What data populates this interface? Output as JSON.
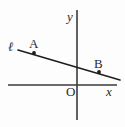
{
  "figure": {
    "background_color": "#fdfdfd",
    "stroke_color": "#1f1f1f",
    "axis_color": "#3a3a3a",
    "labels": {
      "line_name": "ℓ",
      "point_a": "A",
      "point_b": "B",
      "x_axis": "x",
      "y_axis": "y",
      "origin": "O"
    }
  },
  "chart_data": {
    "type": "line",
    "title": "",
    "xlabel": "x",
    "ylabel": "y",
    "grid": false,
    "legend": null,
    "axes": {
      "x_axis": {
        "label": "x",
        "orientation": "horizontal",
        "pixel_y": 85,
        "pixel_x_start": 8,
        "pixel_x_end": 117,
        "ticks": [],
        "tick_labels": []
      },
      "y_axis": {
        "label": "y",
        "orientation": "vertical",
        "pixel_x": 77,
        "pixel_y_start": 10,
        "pixel_y_end": 120,
        "ticks": [],
        "tick_labels": []
      },
      "origin": {
        "label": "O",
        "pixel_x": 77,
        "pixel_y": 85
      }
    },
    "series": [
      {
        "name": "ℓ",
        "type": "line",
        "pixel_start": [
          18,
          50
        ],
        "pixel_end": [
          120,
          80
        ],
        "slope_sign": "negative",
        "points": [
          {
            "name": "A",
            "pixel_x": 34,
            "pixel_y": 53,
            "label_pixel_x": 29,
            "label_pixel_y": 37
          },
          {
            "name": "B",
            "pixel_x": 99,
            "pixel_y": 72,
            "label_pixel_x": 94,
            "label_pixel_y": 57
          }
        ]
      }
    ],
    "annotations": [
      {
        "text": "ℓ",
        "pixel_x": 8,
        "pixel_y": 40
      },
      {
        "text": "A",
        "pixel_x": 29,
        "pixel_y": 37
      },
      {
        "text": "B",
        "pixel_x": 94,
        "pixel_y": 57
      },
      {
        "text": "y",
        "pixel_x": 67,
        "pixel_y": 10
      },
      {
        "text": "x",
        "pixel_x": 106,
        "pixel_y": 85
      },
      {
        "text": "O",
        "pixel_x": 66,
        "pixel_y": 85
      }
    ]
  }
}
